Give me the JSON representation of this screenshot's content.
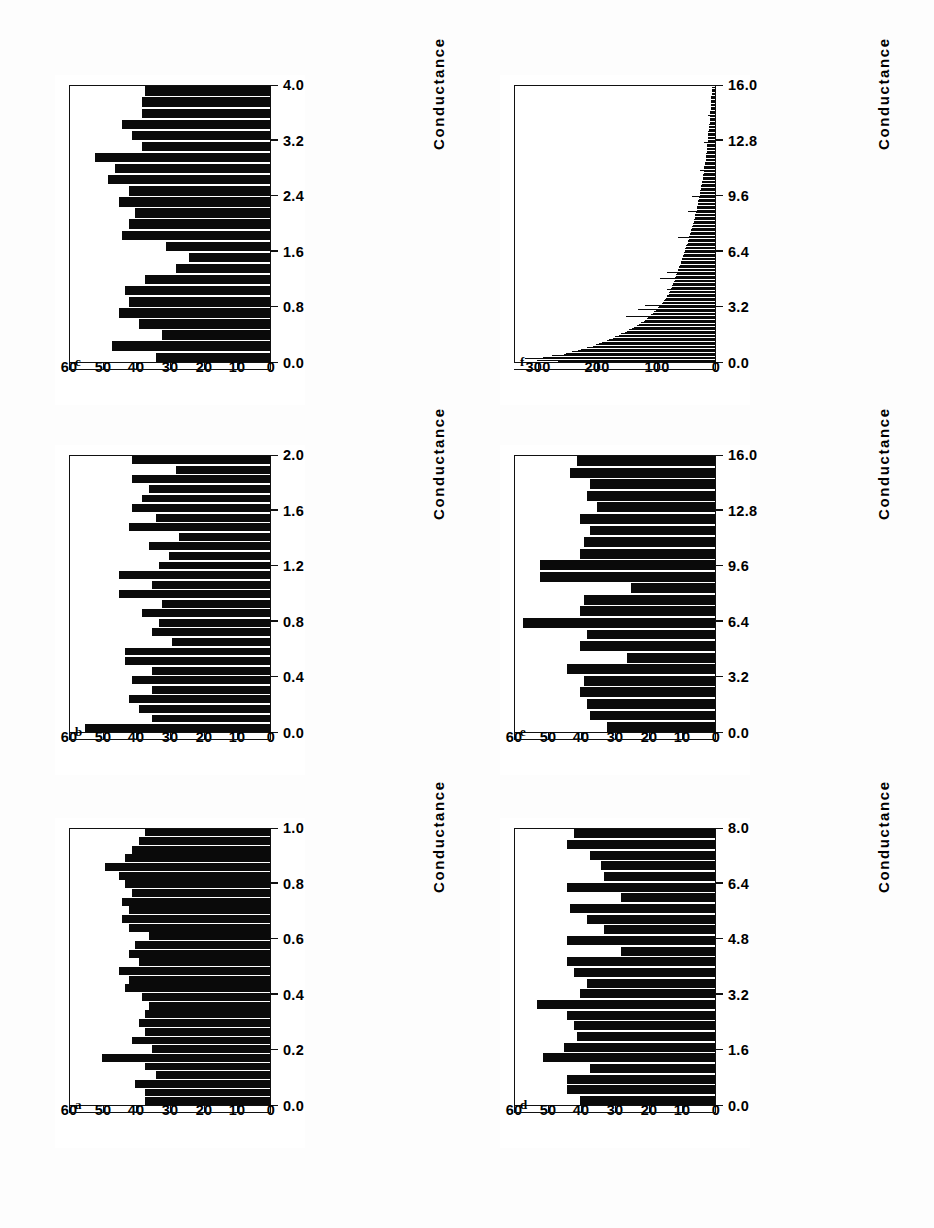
{
  "figure": {
    "orientation": "rotated-90-ccw",
    "panel_count": 6,
    "shared_xlabel": "Conductance",
    "ink_color": "#0a0a0a",
    "background_color": "#ffffff"
  },
  "chart_data": [
    {
      "id": "a",
      "type": "bar",
      "title": "a",
      "xlabel": "Conductance",
      "ylabel": "",
      "xticks": [
        "0.0",
        "0.2",
        "0.4",
        "0.6",
        "0.8",
        "1.0"
      ],
      "xtick_values": [
        0.0,
        0.2,
        0.4,
        0.6,
        0.8,
        1.0
      ],
      "yticks": [
        "0",
        "10",
        "20",
        "30",
        "40",
        "50",
        "60"
      ],
      "ytick_values": [
        0,
        10,
        20,
        30,
        40,
        50,
        60
      ],
      "xlim": [
        0.0,
        1.0
      ],
      "ylim": [
        0,
        60
      ],
      "grid": false,
      "legend": "none",
      "bin_width": 0.05,
      "values": [
        37,
        37,
        40,
        34,
        37,
        50,
        35,
        41,
        37,
        39,
        37,
        36,
        38,
        43,
        42,
        45,
        39,
        42,
        40,
        36,
        42,
        44,
        42,
        44,
        41,
        43,
        45,
        49,
        43,
        41,
        39,
        37
      ]
    },
    {
      "id": "b",
      "type": "bar",
      "title": "b",
      "xlabel": "Conductance",
      "ylabel": "",
      "xticks": [
        "0.0",
        "0.4",
        "0.8",
        "1.2",
        "1.6",
        "2.0"
      ],
      "xtick_values": [
        0.0,
        0.4,
        0.8,
        1.2,
        1.6,
        2.0
      ],
      "yticks": [
        "0",
        "10",
        "20",
        "30",
        "40",
        "50",
        "60"
      ],
      "ytick_values": [
        0,
        10,
        20,
        30,
        40,
        50,
        60
      ],
      "xlim": [
        0.0,
        2.0
      ],
      "ylim": [
        0,
        60
      ],
      "grid": false,
      "legend": "none",
      "bin_width": 0.08,
      "values": [
        55,
        35,
        39,
        42,
        35,
        41,
        35,
        43,
        43,
        29,
        35,
        33,
        38,
        32,
        45,
        35,
        45,
        33,
        30,
        36,
        27,
        42,
        34,
        41,
        38,
        36,
        41,
        28,
        41
      ]
    },
    {
      "id": "c",
      "type": "bar",
      "title": "c",
      "xlabel": "Conductance",
      "ylabel": "",
      "xticks": [
        "0.0",
        "0.8",
        "1.6",
        "2.4",
        "3.2",
        "4.0"
      ],
      "xtick_values": [
        0.0,
        0.8,
        1.6,
        2.4,
        3.2,
        4.0
      ],
      "yticks": [
        "0",
        "10",
        "20",
        "30",
        "40",
        "50",
        "60"
      ],
      "ytick_values": [
        0,
        10,
        20,
        30,
        40,
        50,
        60
      ],
      "xlim": [
        0.0,
        4.0
      ],
      "ylim": [
        0,
        60
      ],
      "grid": false,
      "legend": "none",
      "bin_width": 0.16,
      "values": [
        34,
        47,
        32,
        39,
        45,
        42,
        43,
        37,
        28,
        24,
        31,
        44,
        42,
        40,
        45,
        42,
        48,
        46,
        52,
        38,
        41,
        44,
        38,
        38,
        37
      ]
    },
    {
      "id": "d",
      "type": "bar",
      "title": "d",
      "xlabel": "Conductance",
      "ylabel": "",
      "xticks": [
        "0.0",
        "1.6",
        "3.2",
        "4.8",
        "6.4",
        "8.0"
      ],
      "xtick_values": [
        0.0,
        1.6,
        3.2,
        4.8,
        6.4,
        8.0
      ],
      "yticks": [
        "0",
        "10",
        "20",
        "30",
        "40",
        "50",
        "60"
      ],
      "ytick_values": [
        0,
        10,
        20,
        30,
        40,
        50,
        60
      ],
      "xlim": [
        0.0,
        8.0
      ],
      "ylim": [
        0,
        60
      ],
      "grid": false,
      "legend": "none",
      "bin_width": 0.32,
      "values": [
        40,
        44,
        44,
        37,
        51,
        45,
        41,
        42,
        44,
        53,
        40,
        38,
        42,
        44,
        28,
        44,
        33,
        38,
        43,
        28,
        44,
        33,
        34,
        37,
        44,
        42
      ]
    },
    {
      "id": "e",
      "type": "bar",
      "title": "e",
      "xlabel": "Conductance",
      "ylabel": "",
      "xticks": [
        "0.0",
        "3.2",
        "6.4",
        "9.6",
        "12.8",
        "16.0"
      ],
      "xtick_values": [
        0.0,
        3.2,
        6.4,
        9.6,
        12.8,
        16.0
      ],
      "yticks": [
        "0",
        "10",
        "20",
        "30",
        "40",
        "50",
        "60"
      ],
      "ytick_values": [
        0,
        10,
        20,
        30,
        40,
        50,
        60
      ],
      "xlim": [
        0.0,
        16.0
      ],
      "ylim": [
        0,
        60
      ],
      "grid": false,
      "legend": "none",
      "bin_width": 0.64,
      "values": [
        32,
        37,
        38,
        40,
        39,
        44,
        26,
        40,
        38,
        57,
        40,
        39,
        25,
        52,
        52,
        40,
        39,
        37,
        40,
        35,
        38,
        37,
        43,
        41
      ]
    },
    {
      "id": "f",
      "type": "bar",
      "title": "f",
      "xlabel": "Conductance",
      "ylabel": "",
      "xticks": [
        "0.0",
        "3.2",
        "6.4",
        "9.6",
        "12.8",
        "16.0"
      ],
      "xtick_values": [
        0.0,
        3.2,
        6.4,
        9.6,
        12.8,
        16.0
      ],
      "yticks": [
        "0",
        "100",
        "200",
        "300"
      ],
      "ytick_values": [
        0,
        100,
        200,
        300
      ],
      "xlim": [
        0.0,
        16.0
      ],
      "ylim": [
        0,
        340
      ],
      "grid": false,
      "legend": "none",
      "bin_width": 0.08,
      "values": [
        265,
        300,
        320,
        290,
        275,
        255,
        250,
        240,
        230,
        225,
        215,
        205,
        200,
        195,
        190,
        182,
        178,
        172,
        168,
        162,
        158,
        152,
        148,
        145,
        140,
        136,
        132,
        128,
        124,
        120,
        118,
        114,
        112,
        150,
        108,
        105,
        103,
        100,
        130,
        96,
        94,
        118,
        90,
        88,
        86,
        84,
        83,
        81,
        80,
        78,
        77,
        76,
        80,
        74,
        73,
        72,
        71,
        70,
        69,
        68,
        92,
        67,
        66,
        65,
        64,
        80,
        63,
        62,
        61,
        60,
        59,
        58,
        57,
        57,
        56,
        55,
        54,
        54,
        53,
        52,
        51,
        50,
        50,
        49,
        48,
        47,
        46,
        46,
        45,
        44,
        62,
        43,
        42,
        42,
        41,
        40,
        40,
        39,
        38,
        37,
        37,
        36,
        36,
        35,
        34,
        34,
        33,
        33,
        32,
        46,
        31,
        31,
        30,
        30,
        29,
        29,
        28,
        28,
        27,
        27,
        38,
        26,
        26,
        25,
        25,
        24,
        24,
        23,
        23,
        22,
        22,
        22,
        21,
        21,
        20,
        20,
        20,
        19,
        19,
        26,
        18,
        18,
        18,
        17,
        17,
        17,
        16,
        16,
        16,
        15,
        15,
        15,
        14,
        14,
        14,
        14,
        13,
        13,
        13,
        18,
        12,
        12,
        12,
        12,
        11,
        11,
        11,
        11,
        10,
        10,
        10,
        10,
        10,
        9,
        9,
        9,
        9,
        8,
        8,
        12,
        8,
        8,
        8,
        7,
        7,
        7,
        7,
        7,
        6,
        6,
        6,
        6,
        6,
        6,
        5,
        5,
        5,
        5,
        5,
        5
      ]
    }
  ]
}
